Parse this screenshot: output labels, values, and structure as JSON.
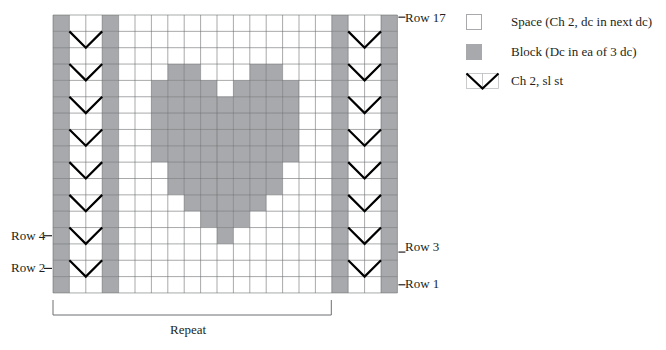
{
  "chart_data": {
    "type": "filet-crochet-chart",
    "columns": 21,
    "rows": 17,
    "colors": {
      "block": "#a7a9ac",
      "space": "#ffffff",
      "grid": "#6d6e71",
      "chevron": "#000000"
    },
    "border_block_columns": [
      0,
      3,
      17,
      20
    ],
    "chevron_column_pairs": [
      [
        1,
        2
      ],
      [
        18,
        19
      ]
    ],
    "chevron_rows_from_top": [
      1,
      3,
      5,
      7,
      9,
      11,
      13,
      15
    ],
    "heart_blocks_by_row_from_top": {
      "3": [
        7,
        8,
        12,
        13
      ],
      "4": [
        6,
        7,
        8,
        9,
        11,
        12,
        13,
        14
      ],
      "5": [
        6,
        7,
        8,
        9,
        10,
        11,
        12,
        13,
        14
      ],
      "6": [
        6,
        7,
        8,
        9,
        10,
        11,
        12,
        13,
        14
      ],
      "7": [
        6,
        7,
        8,
        9,
        10,
        11,
        12,
        13,
        14
      ],
      "8": [
        6,
        7,
        8,
        9,
        10,
        11,
        12,
        13,
        14
      ],
      "9": [
        7,
        8,
        9,
        10,
        11,
        12,
        13
      ],
      "10": [
        7,
        8,
        9,
        10,
        11,
        12,
        13
      ],
      "11": [
        8,
        9,
        10,
        11,
        12
      ],
      "12": [
        9,
        10,
        11
      ],
      "13": [
        10
      ]
    },
    "row_labels": [
      {
        "text": "Row 17",
        "side": "right",
        "row_from_top": 0
      },
      {
        "text": "Row 3",
        "side": "right",
        "row_from_top": 14
      },
      {
        "text": "Row 1",
        "side": "right",
        "row_from_top": 16
      },
      {
        "text": "Row 4",
        "side": "left",
        "row_from_top": 13
      },
      {
        "text": "Row 2",
        "side": "left",
        "row_from_top": 15
      }
    ],
    "repeat_bracket": {
      "label": "Repeat",
      "from_column": 0,
      "to_column": 16
    }
  },
  "labels": {
    "row17": "Row 17",
    "row3": "Row 3",
    "row1": "Row 1",
    "row4": "Row 4",
    "row2": "Row 2",
    "repeat": "Repeat"
  },
  "legend": {
    "items": [
      {
        "symbol": "space",
        "text": "Space (Ch 2, dc in next dc)"
      },
      {
        "symbol": "block",
        "text": "Block (Dc in ea of 3 dc)"
      },
      {
        "symbol": "chevron",
        "text": "Ch 2, sl st"
      }
    ]
  }
}
